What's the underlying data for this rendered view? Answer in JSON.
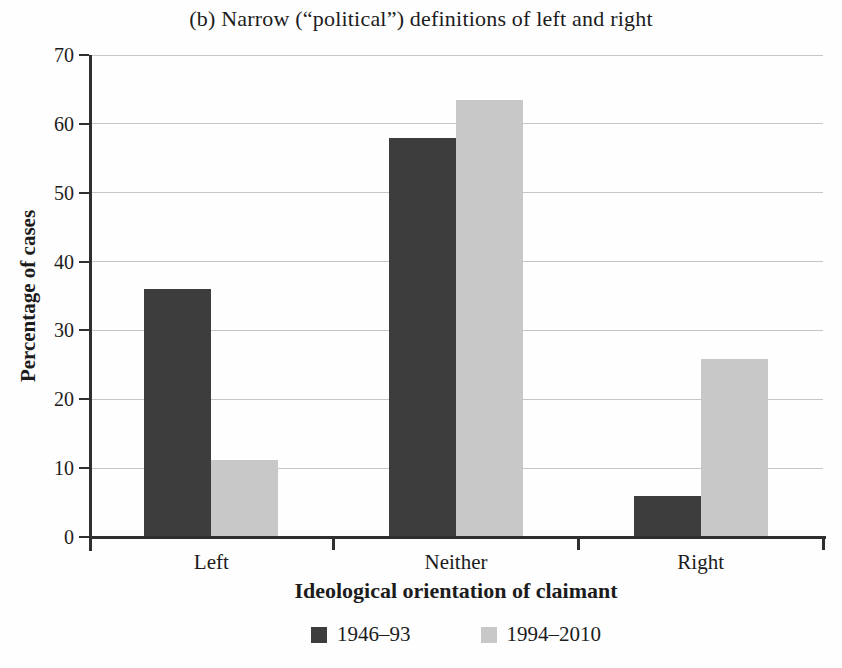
{
  "chart_data": {
    "type": "bar",
    "title": "(b) Narrow (“political”) definitions of left and right",
    "xlabel": "Ideological orientation of claimant",
    "ylabel": "Percentage of cases",
    "categories": [
      "Left",
      "Neither",
      "Right"
    ],
    "series": [
      {
        "name": "1946–93",
        "color": "#3d3d3d",
        "values": [
          36.0,
          58.0,
          6.0
        ]
      },
      {
        "name": "1994–2010",
        "color": "#c8c8c8",
        "values": [
          11.2,
          63.5,
          25.8
        ]
      }
    ],
    "ylim": [
      0,
      70
    ],
    "yticks": [
      0,
      10,
      20,
      30,
      40,
      50,
      60,
      70
    ],
    "grid": true,
    "legend_position": "bottom"
  },
  "colors": {
    "axis": "#2f2f2f",
    "gridline": "#c6c6c6",
    "background": "#fefefe",
    "text": "#1c1c1c"
  }
}
